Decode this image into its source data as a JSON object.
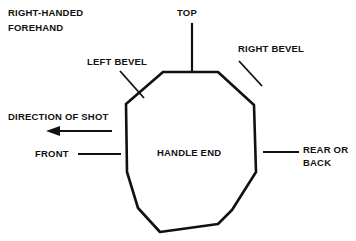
{
  "diagram": {
    "background_color": "#ffffff",
    "ink_color": "#111111",
    "width": 356,
    "height": 241
  },
  "labels": {
    "grip_type_line1": "RIGHT-HANDED",
    "grip_type_line2": "FOREHAND",
    "top": "TOP",
    "left_bevel": "LEFT BEVEL",
    "right_bevel": "RIGHT BEVEL",
    "direction_of_shot": "DIRECTION OF SHOT",
    "front": "FRONT",
    "rear_or_back_line1": "REAR OR",
    "rear_or_back_line2": "BACK",
    "handle_end": "HANDLE END"
  },
  "shape": {
    "name": "octagon",
    "sides": 8,
    "points": "163,72 218,72 254,105 256,172 232,210 218,224 160,232 138,208 127,172 126,104",
    "stroke_width": 2.6
  },
  "leader_lines": {
    "top": {
      "x1": 192,
      "y1": 23,
      "x2": 192,
      "y2": 71,
      "width": 2.2
    },
    "left_bevel": {
      "x1": 120,
      "y1": 71,
      "x2": 144,
      "y2": 98,
      "width": 1.8
    },
    "right_bevel": {
      "x1": 262,
      "y1": 86,
      "x2": 239,
      "y2": 61,
      "width": 1.8
    },
    "front": {
      "x1": 78,
      "y1": 154,
      "x2": 121,
      "y2": 154,
      "width": 1.8
    },
    "rear_or_back": {
      "x1": 263,
      "y1": 152,
      "x2": 299,
      "y2": 152,
      "width": 1.8
    }
  },
  "arrow": {
    "name": "direction-of-shot-arrow",
    "shaft": {
      "x1": 57,
      "y1": 131,
      "x2": 112,
      "y2": 131,
      "width": 2.0
    },
    "head": "46,131 60,126 60,136",
    "direction": "left"
  }
}
